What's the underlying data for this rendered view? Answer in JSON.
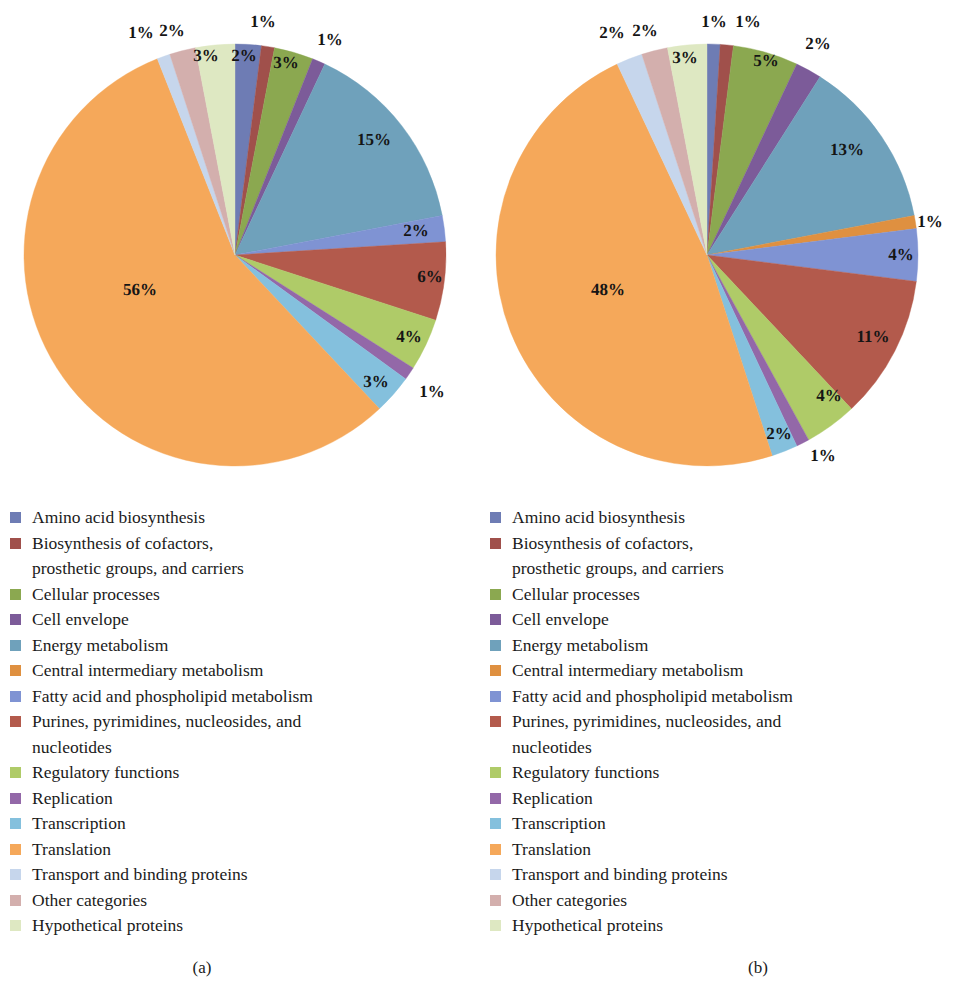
{
  "figure": {
    "background": "#ffffff",
    "panels": [
      {
        "id": "a",
        "caption": "(a)"
      },
      {
        "id": "b",
        "caption": "(b)"
      }
    ]
  },
  "legend_categories": [
    {
      "label": "Amino acid biosynthesis",
      "color": "#6E7CB4"
    },
    {
      "label": "Biosynthesis of cofactors,",
      "label_cont": "prosthetic groups, and carriers",
      "color": "#A0504B"
    },
    {
      "label": "Cellular processes",
      "color": "#8BA850"
    },
    {
      "label": "Cell envelope",
      "color": "#7C5B99"
    },
    {
      "label": "Energy metabolism",
      "color": "#6FA1BB"
    },
    {
      "label": "Central intermediary metabolism",
      "color": "#DF9040"
    },
    {
      "label": "Fatty acid and phospholipid metabolism",
      "color": "#7F93D3"
    },
    {
      "label": "Purines, pyrimidines, nucleosides, and",
      "label_cont": "nucleotides",
      "color": "#B35A4C"
    },
    {
      "label": "Regulatory functions",
      "color": "#AFCB68"
    },
    {
      "label": "Replication",
      "color": "#9368A8"
    },
    {
      "label": "Transcription",
      "color": "#84C0DD"
    },
    {
      "label": "Translation",
      "color": "#F5A85A"
    },
    {
      "label": "Transport and binding proteins",
      "color": "#C6D6EC"
    },
    {
      "label": "Other categories",
      "color": "#D3AFAD"
    },
    {
      "label": "Hypothetical proteins",
      "color": "#DEE8C2"
    }
  ],
  "chart_data": [
    {
      "type": "pie",
      "id": "a",
      "title": "(a)",
      "legend_position": "below",
      "start_angle_deg": 0,
      "direction": "clockwise",
      "categories": [
        "Amino acid biosynthesis",
        "Biosynthesis of cofactors, prosthetic groups, and carriers",
        "Cellular processes",
        "Cell envelope",
        "Energy metabolism",
        "Central intermediary metabolism",
        "Fatty acid and phospholipid metabolism",
        "Purines, pyrimidines, nucleosides, and nucleotides",
        "Regulatory functions",
        "Replication",
        "Transcription",
        "Translation",
        "Transport and binding proteins",
        "Other categories",
        "Hypothetical proteins"
      ],
      "values": [
        2,
        1,
        3,
        1,
        15,
        0,
        2,
        6,
        4,
        1,
        3,
        56,
        1,
        2,
        3
      ],
      "labels": [
        "2%",
        "1%",
        "3%",
        "1%",
        "15%",
        "",
        "2%",
        "6%",
        "4%",
        "1%",
        "3%",
        "56%",
        "1%",
        "2%",
        "3%"
      ],
      "colors": [
        "#6E7CB4",
        "#A0504B",
        "#8BA850",
        "#7C5B99",
        "#6FA1BB",
        "#DF9040",
        "#7F93D3",
        "#B35A4C",
        "#AFCB68",
        "#9368A8",
        "#84C0DD",
        "#F5A85A",
        "#C6D6EC",
        "#D3AFAD",
        "#DEE8C2"
      ]
    },
    {
      "type": "pie",
      "id": "b",
      "title": "(b)",
      "legend_position": "below",
      "start_angle_deg": 0,
      "direction": "clockwise",
      "categories": [
        "Amino acid biosynthesis",
        "Biosynthesis of cofactors, prosthetic groups, and carriers",
        "Cellular processes",
        "Cell envelope",
        "Energy metabolism",
        "Central intermediary metabolism",
        "Fatty acid and phospholipid metabolism",
        "Purines, pyrimidines, nucleosides, and nucleotides",
        "Regulatory functions",
        "Replication",
        "Transcription",
        "Translation",
        "Transport and binding proteins",
        "Other categories",
        "Hypothetical proteins"
      ],
      "values": [
        1,
        1,
        5,
        2,
        13,
        1,
        4,
        11,
        4,
        1,
        2,
        48,
        2,
        2,
        3
      ],
      "labels": [
        "1%",
        "1%",
        "5%",
        "2%",
        "13%",
        "1%",
        "4%",
        "11%",
        "4%",
        "1%",
        "2%",
        "48%",
        "2%",
        "2%",
        "3%"
      ],
      "colors": [
        "#6E7CB4",
        "#A0504B",
        "#8BA850",
        "#7C5B99",
        "#6FA1BB",
        "#DF9040",
        "#7F93D3",
        "#B35A4C",
        "#AFCB68",
        "#9368A8",
        "#84C0DD",
        "#F5A85A",
        "#C6D6EC",
        "#D3AFAD",
        "#DEE8C2"
      ]
    }
  ],
  "callouts": {
    "a": [
      {
        "text": "1%",
        "x": 141,
        "y": 33
      },
      {
        "text": "2%",
        "x": 172,
        "y": 31
      },
      {
        "text": "3%",
        "x": 206,
        "y": 56
      },
      {
        "text": "2%",
        "x": 244,
        "y": 56
      },
      {
        "text": "1%",
        "x": 263,
        "y": 22
      },
      {
        "text": "3%",
        "x": 286,
        "y": 63
      },
      {
        "text": "1%",
        "x": 330,
        "y": 40
      },
      {
        "text": "15%",
        "x": 374,
        "y": 140
      },
      {
        "text": "2%",
        "x": 416,
        "y": 231
      },
      {
        "text": "6%",
        "x": 430,
        "y": 277
      },
      {
        "text": "4%",
        "x": 409,
        "y": 337
      },
      {
        "text": "3%",
        "x": 376,
        "y": 382
      },
      {
        "text": "1%",
        "x": 432,
        "y": 392
      },
      {
        "text": "56%",
        "x": 140,
        "y": 290
      }
    ],
    "b": [
      {
        "text": "2%",
        "x": 612,
        "y": 33
      },
      {
        "text": "2%",
        "x": 645,
        "y": 31
      },
      {
        "text": "3%",
        "x": 685,
        "y": 58
      },
      {
        "text": "1%",
        "x": 714,
        "y": 22
      },
      {
        "text": "1%",
        "x": 748,
        "y": 22
      },
      {
        "text": "5%",
        "x": 766,
        "y": 61
      },
      {
        "text": "2%",
        "x": 818,
        "y": 44
      },
      {
        "text": "13%",
        "x": 847,
        "y": 150
      },
      {
        "text": "1%",
        "x": 930,
        "y": 222
      },
      {
        "text": "4%",
        "x": 901,
        "y": 255
      },
      {
        "text": "11%",
        "x": 873,
        "y": 337
      },
      {
        "text": "4%",
        "x": 829,
        "y": 396
      },
      {
        "text": "2%",
        "x": 779,
        "y": 434
      },
      {
        "text": "1%",
        "x": 823,
        "y": 456
      },
      {
        "text": "48%",
        "x": 608,
        "y": 290
      }
    ]
  },
  "geometry": {
    "pie_a": {
      "cx": 235,
      "cy": 255,
      "r": 211
    },
    "pie_b": {
      "cx": 707,
      "cy": 255,
      "r": 211
    }
  }
}
